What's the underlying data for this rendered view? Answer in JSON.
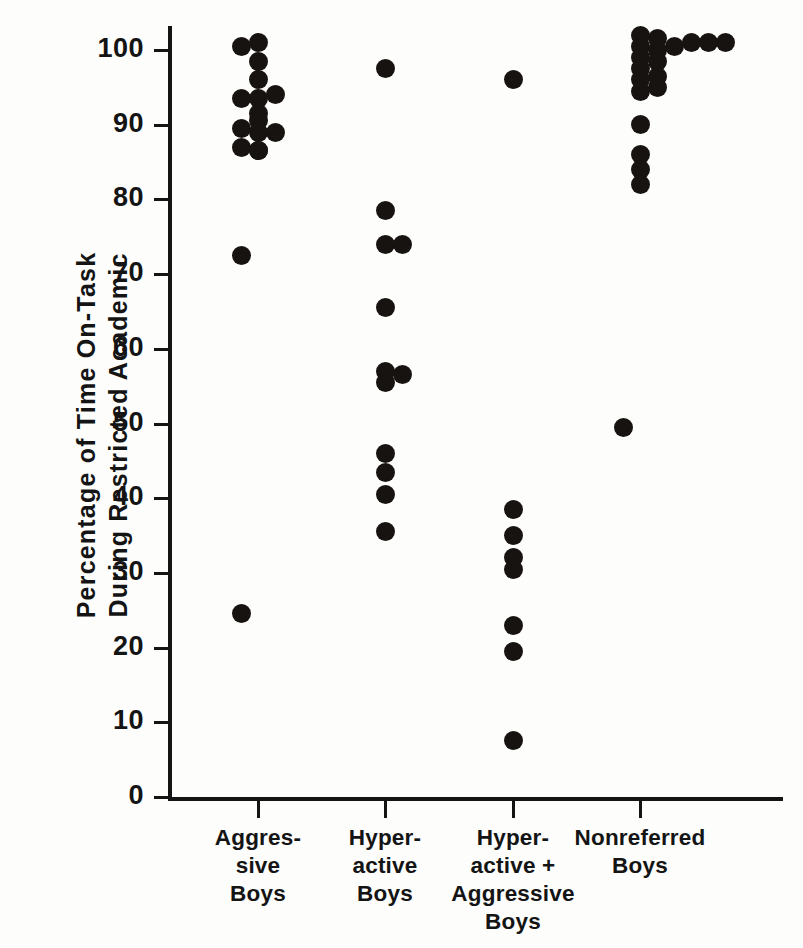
{
  "chart_data": {
    "type": "scatter",
    "title": "",
    "xlabel": "",
    "ylabel": "Percentage of Time On-Task During Restricted Academic",
    "ylabel_lines": [
      "Percentage of Time On-Task",
      "During Restricted Academic"
    ],
    "ylim": [
      0,
      100
    ],
    "yticks": [
      0,
      10,
      20,
      30,
      40,
      50,
      60,
      70,
      80,
      90,
      100
    ],
    "ytick_labels": [
      "0",
      "10",
      "20",
      "30",
      "40",
      "50",
      "60",
      "70",
      "80",
      "90",
      "100"
    ],
    "grid": false,
    "legend": "none",
    "categories": [
      "Aggres-\nsive\nBoys",
      "Hyper-\nactive\nBoys",
      "Hyper-\nactive +\nAggressive\nBoys",
      "Nonreferred\nBoys"
    ],
    "category_label_lines": [
      [
        "Aggres-",
        "sive",
        "Boys"
      ],
      [
        "Hyper-",
        "active",
        "Boys"
      ],
      [
        "Hyper-",
        "active +",
        "Aggressive",
        "Boys"
      ],
      [
        "Nonreferred",
        "Boys"
      ]
    ],
    "marker": "filled-circle",
    "marker_color": "#171310",
    "marker_size_px": 19,
    "series": [
      {
        "name": "Aggressive Boys",
        "category_index": 0,
        "n": 17,
        "points": [
          {
            "jitter": -1,
            "value": 100.5
          },
          {
            "jitter": 0,
            "value": 101.0
          },
          {
            "jitter": 0,
            "value": 98.5
          },
          {
            "jitter": 0,
            "value": 96.0
          },
          {
            "jitter": -1,
            "value": 93.5
          },
          {
            "jitter": 0,
            "value": 93.5
          },
          {
            "jitter": 1,
            "value": 94.0
          },
          {
            "jitter": 0,
            "value": 91.5
          },
          {
            "jitter": 0,
            "value": 90.5
          },
          {
            "jitter": -1,
            "value": 89.5
          },
          {
            "jitter": 0,
            "value": 89.0
          },
          {
            "jitter": 1,
            "value": 89.0
          },
          {
            "jitter": -1,
            "value": 87.0
          },
          {
            "jitter": 0,
            "value": 86.5
          },
          {
            "jitter": 0,
            "value": 86.5
          },
          {
            "jitter": -1,
            "value": 72.5
          },
          {
            "jitter": -1,
            "value": 24.5
          }
        ]
      },
      {
        "name": "Hyperactive Boys",
        "category_index": 1,
        "n": 13,
        "points": [
          {
            "jitter": 0,
            "value": 97.5
          },
          {
            "jitter": 0,
            "value": 78.5
          },
          {
            "jitter": 0,
            "value": 74.0
          },
          {
            "jitter": 1,
            "value": 74.0
          },
          {
            "jitter": 0,
            "value": 65.5
          },
          {
            "jitter": 0,
            "value": 57.0
          },
          {
            "jitter": 0,
            "value": 55.5
          },
          {
            "jitter": 1,
            "value": 56.5
          },
          {
            "jitter": 0,
            "value": 46.0
          },
          {
            "jitter": 0,
            "value": 43.5
          },
          {
            "jitter": 0,
            "value": 40.5
          },
          {
            "jitter": 0,
            "value": 35.5
          }
        ]
      },
      {
        "name": "Hyperactive + Aggressive Boys",
        "category_index": 2,
        "n": 8,
        "points": [
          {
            "jitter": 0,
            "value": 96.0
          },
          {
            "jitter": 0,
            "value": 38.5
          },
          {
            "jitter": 0,
            "value": 35.0
          },
          {
            "jitter": 0,
            "value": 32.0
          },
          {
            "jitter": 0,
            "value": 30.5
          },
          {
            "jitter": 0,
            "value": 23.0
          },
          {
            "jitter": 0,
            "value": 19.5
          },
          {
            "jitter": 0,
            "value": 7.5
          }
        ]
      },
      {
        "name": "Nonreferred Boys",
        "category_index": 3,
        "n": 23,
        "points": [
          {
            "jitter": 0,
            "value": 102.0
          },
          {
            "jitter": 0,
            "value": 100.5
          },
          {
            "jitter": 0,
            "value": 99.0
          },
          {
            "jitter": 0,
            "value": 97.5
          },
          {
            "jitter": 0,
            "value": 96.0
          },
          {
            "jitter": 0,
            "value": 94.5
          },
          {
            "jitter": 1,
            "value": 101.5
          },
          {
            "jitter": 1,
            "value": 100.0
          },
          {
            "jitter": 1,
            "value": 98.5
          },
          {
            "jitter": 1,
            "value": 96.5
          },
          {
            "jitter": 1,
            "value": 95.0
          },
          {
            "jitter": 2,
            "value": 100.5
          },
          {
            "jitter": 3,
            "value": 101.0
          },
          {
            "jitter": 4,
            "value": 101.0
          },
          {
            "jitter": 5,
            "value": 101.0
          },
          {
            "jitter": 0,
            "value": 90.0
          },
          {
            "jitter": 0,
            "value": 86.0
          },
          {
            "jitter": 0,
            "value": 84.0
          },
          {
            "jitter": 0,
            "value": 82.0
          },
          {
            "jitter": -1,
            "value": 49.5
          }
        ]
      }
    ]
  },
  "axes": {
    "y_axis_name": "percentage-axis",
    "x_axis_name": "group-axis"
  }
}
